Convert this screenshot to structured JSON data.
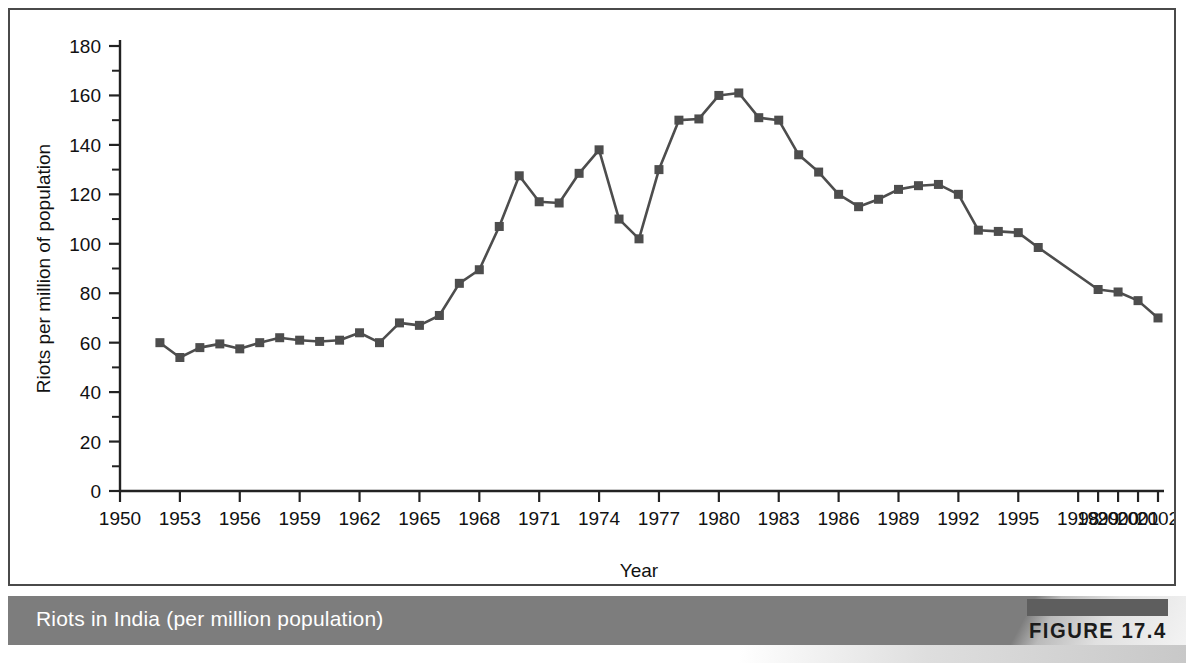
{
  "figure": {
    "caption": "Riots in India (per million population)",
    "tag": "FIGURE 17.4"
  },
  "colors": {
    "series": "#4d4d4d",
    "axis": "#222222",
    "caption_bar": "#7d7d7d",
    "caption_text": "#ffffff",
    "tag_bar": "#5e5e5e",
    "tag_text": "#1b1b1b",
    "frame_border": "#4a4a4a",
    "plot_background": "#ffffff"
  },
  "chart_data": {
    "type": "line",
    "title": "",
    "xlabel": "Year",
    "ylabel": "Riots per million of population",
    "xlim": [
      1950,
      2002
    ],
    "ylim": [
      0,
      180
    ],
    "ytick_step": 20,
    "yminor_step": 10,
    "grid": false,
    "legend": null,
    "marker": "square",
    "ytick_labels": [
      "0",
      "20",
      "40",
      "60",
      "80",
      "100",
      "120",
      "140",
      "160",
      "180"
    ],
    "ytick_values": [
      0,
      20,
      40,
      60,
      80,
      100,
      120,
      140,
      160,
      180
    ],
    "xtick_labels": [
      "1950",
      "1953",
      "1956",
      "1959",
      "1962",
      "1965",
      "1968",
      "1971",
      "1974",
      "1977",
      "1980",
      "1983",
      "1986",
      "1989",
      "1992",
      "1995",
      "1998",
      "1999",
      "2000",
      "2001",
      "2002"
    ],
    "xtick_values": [
      1950,
      1953,
      1956,
      1959,
      1962,
      1965,
      1968,
      1971,
      1974,
      1977,
      1980,
      1983,
      1986,
      1989,
      1992,
      1995,
      1998,
      1999,
      2000,
      2001,
      2002
    ],
    "x": [
      1952,
      1953,
      1954,
      1955,
      1956,
      1957,
      1958,
      1959,
      1960,
      1961,
      1962,
      1963,
      1964,
      1965,
      1966,
      1967,
      1968,
      1969,
      1970,
      1971,
      1972,
      1973,
      1974,
      1975,
      1976,
      1977,
      1978,
      1979,
      1980,
      1981,
      1982,
      1983,
      1984,
      1985,
      1986,
      1987,
      1988,
      1989,
      1990,
      1991,
      1992,
      1993,
      1994,
      1995,
      1996,
      1999,
      2000,
      2001,
      2002
    ],
    "values": [
      60,
      54,
      58,
      59.5,
      57.5,
      60,
      62,
      61,
      60.5,
      61,
      64,
      60,
      68,
      67,
      71,
      84,
      89.5,
      107,
      127.5,
      117,
      116.5,
      128.5,
      138,
      110,
      102,
      130,
      150,
      150.5,
      160,
      161,
      151,
      150,
      136,
      129,
      120,
      115,
      118,
      122,
      123.5,
      124,
      120,
      105.5,
      105,
      104.5,
      98.5,
      81.5,
      80.5,
      77,
      70
    ],
    "series": [
      {
        "name": "Riots per million of population",
        "values": [
          60,
          54,
          58,
          59.5,
          57.5,
          60,
          62,
          61,
          60.5,
          61,
          64,
          60,
          68,
          67,
          71,
          84,
          89.5,
          107,
          127.5,
          117,
          116.5,
          128.5,
          138,
          110,
          102,
          130,
          150,
          150.5,
          160,
          161,
          151,
          150,
          136,
          129,
          120,
          115,
          118,
          122,
          123.5,
          124,
          120,
          105.5,
          105,
          104.5,
          98.5,
          81.5,
          80.5,
          77,
          70
        ]
      }
    ]
  }
}
